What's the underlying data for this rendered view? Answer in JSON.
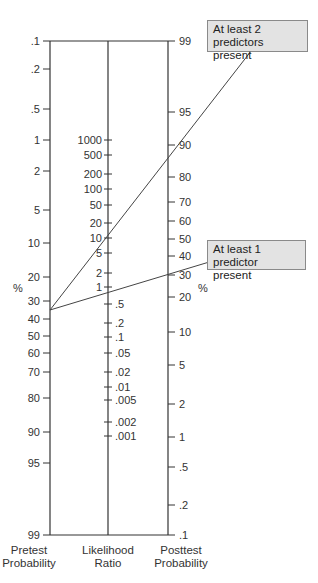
{
  "nomogram": {
    "title": "Fagan nomogram",
    "axes": {
      "pretest": {
        "title_line1": "Pretest",
        "title_line2": "Probability",
        "unit": "%",
        "ticks": [
          {
            "label": ".1",
            "y": 41
          },
          {
            "label": ".2",
            "y": 69
          },
          {
            "label": ".5",
            "y": 109
          },
          {
            "label": "1",
            "y": 140
          },
          {
            "label": "2",
            "y": 171
          },
          {
            "label": "5",
            "y": 210
          },
          {
            "label": "10",
            "y": 243
          },
          {
            "label": "20",
            "y": 277
          },
          {
            "label": "30",
            "y": 301
          },
          {
            "label": "40",
            "y": 319
          },
          {
            "label": "50",
            "y": 336
          },
          {
            "label": "60",
            "y": 353
          },
          {
            "label": "70",
            "y": 372
          },
          {
            "label": "80",
            "y": 398
          },
          {
            "label": "90",
            "y": 432
          },
          {
            "label": "95",
            "y": 463
          },
          {
            "label": "99",
            "y": 535
          }
        ]
      },
      "likelihood_ratio": {
        "title_line1": "Likelihood",
        "title_line2": "Ratio",
        "ticks_upper": [
          {
            "label": "1000",
            "y": 140
          },
          {
            "label": "500",
            "y": 155
          },
          {
            "label": "200",
            "y": 174
          },
          {
            "label": "100",
            "y": 189
          },
          {
            "label": "50",
            "y": 205
          },
          {
            "label": "20",
            "y": 223
          },
          {
            "label": "10",
            "y": 238
          },
          {
            "label": "5",
            "y": 253
          },
          {
            "label": "2",
            "y": 273
          },
          {
            "label": "1",
            "y": 287
          }
        ],
        "ticks_lower": [
          {
            "label": ".5",
            "y": 304
          },
          {
            "label": ".2",
            "y": 323
          },
          {
            "label": ".1",
            "y": 337
          },
          {
            "label": ".05",
            "y": 353
          },
          {
            "label": ".02",
            "y": 372
          },
          {
            "label": ".01",
            "y": 387
          },
          {
            "label": ".005",
            "y": 400
          },
          {
            "label": ".002",
            "y": 422
          },
          {
            "label": ".001",
            "y": 436
          }
        ]
      },
      "posttest": {
        "title_line1": "Posttest",
        "title_line2": "Probability",
        "unit": "%",
        "ticks": [
          {
            "label": "99",
            "y": 41
          },
          {
            "label": "95",
            "y": 112
          },
          {
            "label": "90",
            "y": 145
          },
          {
            "label": "80",
            "y": 177
          },
          {
            "label": "70",
            "y": 202
          },
          {
            "label": "60",
            "y": 221
          },
          {
            "label": "50",
            "y": 239
          },
          {
            "label": "40",
            "y": 256
          },
          {
            "label": "30",
            "y": 275
          },
          {
            "label": "20",
            "y": 297
          },
          {
            "label": "10",
            "y": 332
          },
          {
            "label": "5",
            "y": 365
          },
          {
            "label": "2",
            "y": 404
          },
          {
            "label": "1",
            "y": 437
          },
          {
            "label": ".5",
            "y": 467
          },
          {
            "label": ".2",
            "y": 505
          },
          {
            "label": ".1",
            "y": 535
          }
        ]
      }
    },
    "lines": [
      {
        "label": "At least 2 predictors present",
        "pretest_pct": 35,
        "lr": 12,
        "posttest_pct": 87
      },
      {
        "label": "At least 1 predictor present",
        "pretest_pct": 35,
        "lr": 1.2,
        "posttest_pct": 40
      }
    ],
    "callouts": {
      "two_predictors_line1": "At least 2 predictors",
      "two_predictors_line2": "present",
      "one_predictor_line1": "At least 1 predictor",
      "one_predictor_line2": "present"
    },
    "colors": {
      "axis": "#333333",
      "callout_fill": "#e3e3e3",
      "callout_border": "#8a8a8a"
    }
  }
}
